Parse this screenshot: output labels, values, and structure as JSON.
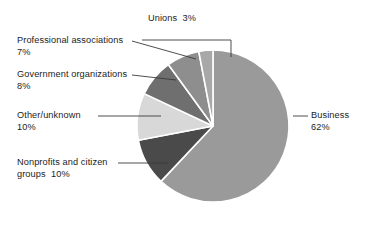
{
  "chart_data": {
    "type": "pie",
    "title": "",
    "subtitle": "",
    "xlabel": "",
    "ylabel": "",
    "legend_position": "none",
    "grid": false,
    "units": "percent",
    "total": 100,
    "categories": [
      "Business",
      "Nonprofits and citizen groups",
      "Other/unknown",
      "Government organizations",
      "Professional associations",
      "Unions"
    ],
    "values": [
      62,
      10,
      10,
      8,
      7,
      3
    ],
    "slices": [
      {
        "name": "Business",
        "label_text": "Business",
        "value_text": "62%",
        "value": 62,
        "color": "#9a9a9a",
        "start_angle": 0,
        "end_angle": 223.2,
        "label_side": "right"
      },
      {
        "name": "Nonprofits and citizen groups",
        "label_text": "Nonprofits and citizen",
        "label_text_line2": "groups  10%",
        "value_text": "10%",
        "value": 10,
        "color": "#4a4a4a",
        "start_angle": 223.2,
        "end_angle": 259.2,
        "label_side": "left"
      },
      {
        "name": "Other/unknown",
        "label_text": "Other/unknown",
        "label_text_line2": "10%",
        "value_text": "10%",
        "value": 10,
        "color": "#d8d8d8",
        "start_angle": 259.2,
        "end_angle": 295.2,
        "label_side": "left"
      },
      {
        "name": "Government organizations",
        "label_text": "Government organizations",
        "label_text_line2": "8%",
        "value_text": "8%",
        "value": 8,
        "color": "#6f6f6f",
        "start_angle": 295.2,
        "end_angle": 324.0,
        "label_side": "left"
      },
      {
        "name": "Professional associations",
        "label_text": "Professional associations",
        "label_text_line2": "7%",
        "value_text": "7%",
        "value": 7,
        "color": "#8e8e8e",
        "start_angle": 324.0,
        "end_angle": 349.2,
        "label_side": "left"
      },
      {
        "name": "Unions",
        "label_text": "Unions  3%",
        "value_text": "3%",
        "value": 3,
        "color": "#a8a8a8",
        "start_angle": 349.2,
        "end_angle": 360.0,
        "label_side": "top"
      }
    ],
    "geometry": {
      "center_x": 213,
      "center_y": 126,
      "radius": 76,
      "separator_color": "#ffffff",
      "separator_width": 1.6
    },
    "colors": {
      "background": "#ffffff",
      "text": "#1c1c1c",
      "leader_line": "#3a3a3a"
    }
  },
  "labels": {
    "business": "Business\n62%",
    "nonprofits": "Nonprofits and citizen\ngroups  10%",
    "other": "Other/unknown\n10%",
    "government": "Government organizations\n8%",
    "professional": "Professional associations\n7%",
    "unions": "Unions  3%"
  }
}
